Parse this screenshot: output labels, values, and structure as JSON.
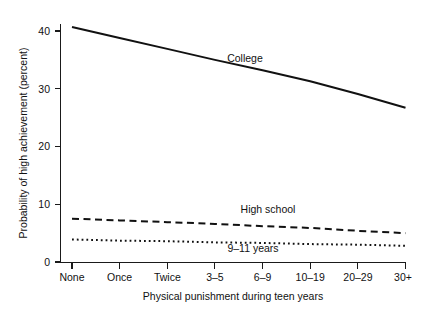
{
  "chart_data": {
    "type": "line",
    "title": "",
    "xlabel": "Physical punishment during teen years",
    "ylabel": "Probability of high achievement (percent)",
    "categories": [
      "None",
      "Once",
      "Twice",
      "3–5",
      "6–9",
      "10–19",
      "20–29",
      "30+"
    ],
    "ylim": [
      0,
      42
    ],
    "yticks": [
      0,
      10,
      20,
      30,
      40
    ],
    "ytick_labels": [
      "0",
      "10",
      "20",
      "30",
      "40"
    ],
    "grid": false,
    "legend_position": "inline-labels",
    "series": [
      {
        "name": "College",
        "style": "solid",
        "label": "College",
        "values": [
          40.7,
          38.8,
          36.9,
          35.0,
          33.2,
          31.3,
          29.1,
          26.7
        ]
      },
      {
        "name": "High school",
        "style": "dashed",
        "label": "High school",
        "values": [
          7.5,
          7.2,
          6.9,
          6.6,
          6.2,
          5.9,
          5.4,
          5.0
        ]
      },
      {
        "name": "9–11 years",
        "style": "dotted",
        "label": "9–11 years",
        "values": [
          3.9,
          3.7,
          3.6,
          3.4,
          3.3,
          3.1,
          3.0,
          2.8
        ]
      }
    ]
  },
  "labels": {
    "y_axis_title": "Probability of high achievement (percent)",
    "x_axis_title": "Physical punishment during teen years",
    "series_college": "College",
    "series_high_school": "High school",
    "series_nine_eleven": "9–11 years",
    "ytick_0": "0",
    "ytick_10": "10",
    "ytick_20": "20",
    "ytick_30": "30",
    "ytick_40": "40",
    "xtick_none": "None",
    "xtick_once": "Once",
    "xtick_twice": "Twice",
    "xtick_3_5": "3–5",
    "xtick_6_9": "6–9",
    "xtick_10_19": "10–19",
    "xtick_20_29": "20–29",
    "xtick_30plus": "30+"
  },
  "colors": {
    "ink": "#111111",
    "axis": "#1a1a1a",
    "background": "#ffffff"
  }
}
